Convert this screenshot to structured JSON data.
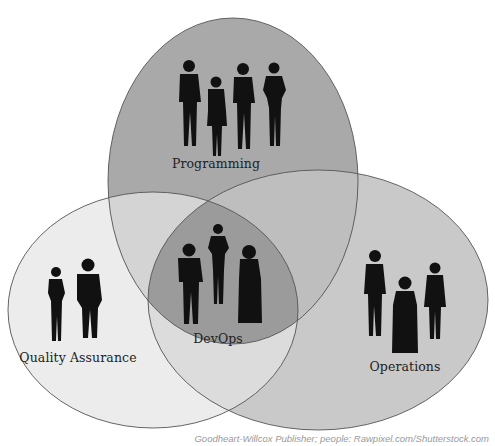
{
  "diagram": {
    "type": "venn",
    "sets": [
      {
        "id": "programming",
        "label": "Programming",
        "people_count": 4,
        "fill": "#a9a9a9"
      },
      {
        "id": "quality_assurance",
        "label": "Quality Assurance",
        "people_count": 2,
        "fill": "#ececec"
      },
      {
        "id": "operations",
        "label": "Operations",
        "people_count": 3,
        "fill": "#c9c9c9"
      }
    ],
    "intersection": {
      "id": "devops",
      "label": "DevOps",
      "people_count": 3,
      "fill": "#9b9b9b"
    },
    "stroke_color": "#555555",
    "silhouette_color": "#111111"
  },
  "labels": {
    "programming": "Programming",
    "quality_assurance": "Quality Assurance",
    "operations": "Operations",
    "devops": "DevOps"
  },
  "icons": {
    "programming_people": "people-silhouette-group",
    "qa_people": "people-silhouette-group",
    "operations_people": "people-silhouette-group",
    "devops_people": "people-silhouette-group"
  },
  "credit": "Goodheart-Willcox Publisher; people: Rawpixel.com/Shutterstock.com"
}
